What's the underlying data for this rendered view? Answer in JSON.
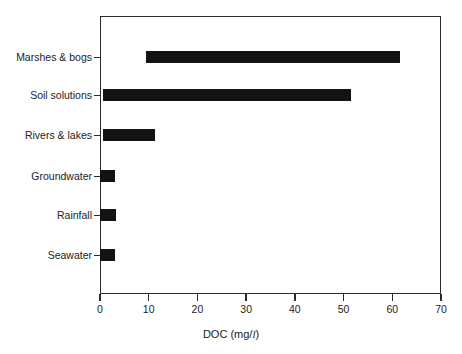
{
  "chart_data": {
    "type": "bar",
    "orientation": "horizontal",
    "title": "",
    "xlabel": "DOC (mg/l)",
    "xlabel_prefix": "DOC (mg/",
    "xlabel_unit_italic": "l",
    "xlabel_suffix": ")",
    "ylabel": "",
    "xlim": [
      0,
      70
    ],
    "xticks": [
      0,
      10,
      20,
      30,
      40,
      50,
      60,
      70
    ],
    "xticklabels": [
      "0",
      "10",
      "20",
      "30",
      "40",
      "50",
      "60",
      "70"
    ],
    "grid": false,
    "legend": false,
    "bar_color": "#131313",
    "frame_color": "#2b2b2b",
    "note": "Each bar is a range (min to max concentration) rather than a single value.",
    "categories": [
      "Marshes & bogs",
      "Soil solutions",
      "Rivers & lakes",
      "Groundwater",
      "Rainfall",
      "Seawater"
    ],
    "ranges": [
      {
        "category": "Marshes & bogs",
        "low": 9.5,
        "high": 61.5
      },
      {
        "category": "Soil solutions",
        "low": 0.6,
        "high": 51.5
      },
      {
        "category": "Rivers & lakes",
        "low": 0.6,
        "high": 11.3
      },
      {
        "category": "Groundwater",
        "low": 0.0,
        "high": 3.0
      },
      {
        "category": "Rainfall",
        "low": 0.0,
        "high": 3.2
      },
      {
        "category": "Seawater",
        "low": 0.0,
        "high": 3.0
      }
    ]
  }
}
